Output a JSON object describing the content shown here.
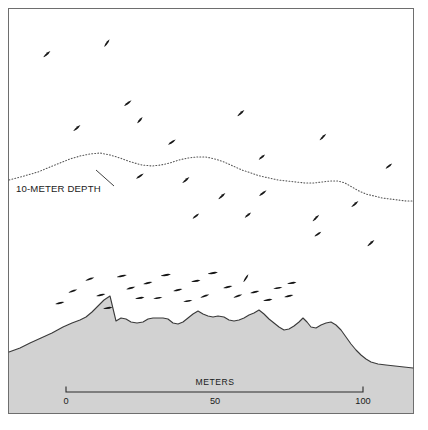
{
  "figure": {
    "title_visible": false,
    "background_color": "#ffffff",
    "frame": {
      "stroke_color": "#6e6e6e",
      "x": 8.5,
      "y": 8.5,
      "width": 405,
      "height": 405
    }
  },
  "annotations": {
    "depth_contour_label": "10-METER DEPTH",
    "depth_contour_label_x": 16,
    "depth_contour_label_y": 192,
    "leader_line": "M 96 170 L 114 186"
  },
  "scale_bar": {
    "title": "METERS",
    "title_x": 215,
    "title_y": 385,
    "tick_labels": [
      "0",
      "50",
      "100"
    ],
    "tick_values": [
      0,
      50,
      100
    ],
    "tick_x_positions": [
      66,
      215,
      363
    ],
    "axis_y": 392,
    "tick_length": 5,
    "label_y": 404,
    "units": "meters",
    "length_meters": 100
  },
  "chart_data": {
    "type": "area",
    "title": "",
    "subtitle": "",
    "xlabel": "METERS",
    "ylabel": "",
    "xlim": [
      0,
      100
    ],
    "grid": false,
    "legend": "none",
    "annotations": [
      "10-METER DEPTH"
    ],
    "series": [
      {
        "name": "seafloor profile",
        "kind": "filled-area",
        "fill_color": "#d2d2d2",
        "stroke_color": "#3a3a3a",
        "path": "M 9 352 L 20 348 L 30 343 L 41 338 L 52 333 L 63 327 L 72 323 L 80 320 L 86 317 L 92 312 L 98 306 L 104 300 L 110 296 L 116 321 L 121 318 L 126 319 L 131 322 L 137 323 L 143 322 L 148 319 L 153 318 L 158 318 L 163 318 L 168 319 L 173 323 L 178 324 L 183 322 L 188 318 L 193 314 L 198 311 L 203 314 L 208 316 L 213 317 L 218 316 L 224 317 L 229 320 L 234 321 L 239 320 L 244 318 L 249 315 L 254 313 L 259 310 L 264 314 L 269 319 L 274 323 L 279 327 L 284 330 L 289 329 L 294 326 L 299 322 L 303 318 L 307 322 L 311 327 L 316 328 L 321 325 L 326 323 L 331 322 L 336 325 L 341 330 L 346 337 L 351 344 L 356 350 L 361 355 L 366 359 L 371 362 L 378 364 L 386 365 L 395 366 L 404 367 L 413 368 L 413 413 L 9 413 Z",
        "outline_path": "M 9 352 L 20 348 L 30 343 L 41 338 L 52 333 L 63 327 L 72 323 L 80 320 L 86 317 L 92 312 L 98 306 L 104 300 L 110 296 L 116 321 L 121 318 L 126 319 L 131 322 L 137 323 L 143 322 L 148 319 L 153 318 L 158 318 L 163 318 L 168 319 L 173 323 L 178 324 L 183 322 L 188 318 L 193 314 L 198 311 L 203 314 L 208 316 L 213 317 L 218 316 L 224 317 L 229 320 L 234 321 L 239 320 L 244 318 L 249 315 L 254 313 L 259 310 L 264 314 L 269 319 L 274 323 L 279 327 L 284 330 L 289 329 L 294 326 L 299 322 L 303 318 L 307 322 L 311 327 L 316 328 L 321 325 L 326 323 L 331 322 L 336 325 L 341 330 L 346 337 L 351 344 L 356 350 L 361 355 L 366 359 L 371 362 L 378 364 L 386 365 L 395 366 L 404 367 L 413 368"
      },
      {
        "name": "10-meter depth contour",
        "kind": "dotted-line",
        "stroke_color": "#555555",
        "path": "M 9 180 L 24 176 L 38 172 L 50 167 L 60 163 L 70 159 L 80 156 L 90 154 L 100 153 L 110 155 L 120 158 L 131 162 L 142 165 L 152 166 L 161 165 L 170 163 L 179 160 L 188 158 L 197 157 L 206 157 L 215 159 L 224 162 L 233 166 L 242 170 L 251 173 L 260 176 L 269 178 L 278 180 L 287 181 L 296 182 L 305 183 L 314 183 L 322 182 L 330 181 L 338 181 L 345 183 L 352 187 L 359 191 L 366 194 L 374 196 L 382 198 L 390 199 L 398 200 L 406 201 L 413 201"
      }
    ],
    "fish_marks": {
      "description": "small elongated fish symbols representing individual fish observed in the water column",
      "count": 44,
      "color": "#151515",
      "points": [
        {
          "x": 47,
          "y": 54,
          "angle": -42,
          "len": 9
        },
        {
          "x": 107,
          "y": 43,
          "angle": -55,
          "len": 9
        },
        {
          "x": 77,
          "y": 128,
          "angle": -40,
          "len": 9
        },
        {
          "x": 128,
          "y": 103,
          "angle": -38,
          "len": 9
        },
        {
          "x": 140,
          "y": 120,
          "angle": -50,
          "len": 8
        },
        {
          "x": 172,
          "y": 142,
          "angle": -35,
          "len": 9
        },
        {
          "x": 241,
          "y": 113,
          "angle": -42,
          "len": 9
        },
        {
          "x": 262,
          "y": 157,
          "angle": -40,
          "len": 8
        },
        {
          "x": 323,
          "y": 137,
          "angle": -45,
          "len": 9
        },
        {
          "x": 389,
          "y": 166,
          "angle": -38,
          "len": 8
        },
        {
          "x": 140,
          "y": 176,
          "angle": -35,
          "len": 9
        },
        {
          "x": 186,
          "y": 180,
          "angle": -40,
          "len": 9
        },
        {
          "x": 222,
          "y": 196,
          "angle": -42,
          "len": 9
        },
        {
          "x": 263,
          "y": 193,
          "angle": -38,
          "len": 9
        },
        {
          "x": 316,
          "y": 218,
          "angle": -45,
          "len": 9
        },
        {
          "x": 355,
          "y": 204,
          "angle": -40,
          "len": 9
        },
        {
          "x": 318,
          "y": 234,
          "angle": -35,
          "len": 8
        },
        {
          "x": 371,
          "y": 243,
          "angle": -42,
          "len": 9
        },
        {
          "x": 248,
          "y": 215,
          "angle": -40,
          "len": 8
        },
        {
          "x": 196,
          "y": 216,
          "angle": -38,
          "len": 8
        },
        {
          "x": 73,
          "y": 291,
          "angle": -20,
          "len": 9
        },
        {
          "x": 90,
          "y": 279,
          "angle": -18,
          "len": 9
        },
        {
          "x": 101,
          "y": 295,
          "angle": -12,
          "len": 9
        },
        {
          "x": 122,
          "y": 276,
          "angle": -12,
          "len": 10
        },
        {
          "x": 131,
          "y": 288,
          "angle": -15,
          "len": 9
        },
        {
          "x": 140,
          "y": 298,
          "angle": -10,
          "len": 9
        },
        {
          "x": 148,
          "y": 283,
          "angle": -12,
          "len": 9
        },
        {
          "x": 158,
          "y": 298,
          "angle": -8,
          "len": 9
        },
        {
          "x": 166,
          "y": 275,
          "angle": -10,
          "len": 10
        },
        {
          "x": 178,
          "y": 290,
          "angle": -14,
          "len": 9
        },
        {
          "x": 188,
          "y": 301,
          "angle": -8,
          "len": 9
        },
        {
          "x": 196,
          "y": 281,
          "angle": -10,
          "len": 9
        },
        {
          "x": 205,
          "y": 296,
          "angle": -18,
          "len": 9
        },
        {
          "x": 213,
          "y": 273,
          "angle": -10,
          "len": 10
        },
        {
          "x": 228,
          "y": 287,
          "angle": -12,
          "len": 9
        },
        {
          "x": 238,
          "y": 296,
          "angle": -20,
          "len": 9
        },
        {
          "x": 246,
          "y": 278,
          "angle": -58,
          "len": 9
        },
        {
          "x": 255,
          "y": 292,
          "angle": -12,
          "len": 9
        },
        {
          "x": 268,
          "y": 300,
          "angle": -10,
          "len": 9
        },
        {
          "x": 278,
          "y": 288,
          "angle": -8,
          "len": 9
        },
        {
          "x": 289,
          "y": 296,
          "angle": -12,
          "len": 9
        },
        {
          "x": 292,
          "y": 283,
          "angle": -10,
          "len": 9
        },
        {
          "x": 108,
          "y": 308,
          "angle": -10,
          "len": 9
        },
        {
          "x": 60,
          "y": 303,
          "angle": -14,
          "len": 9
        }
      ]
    }
  }
}
